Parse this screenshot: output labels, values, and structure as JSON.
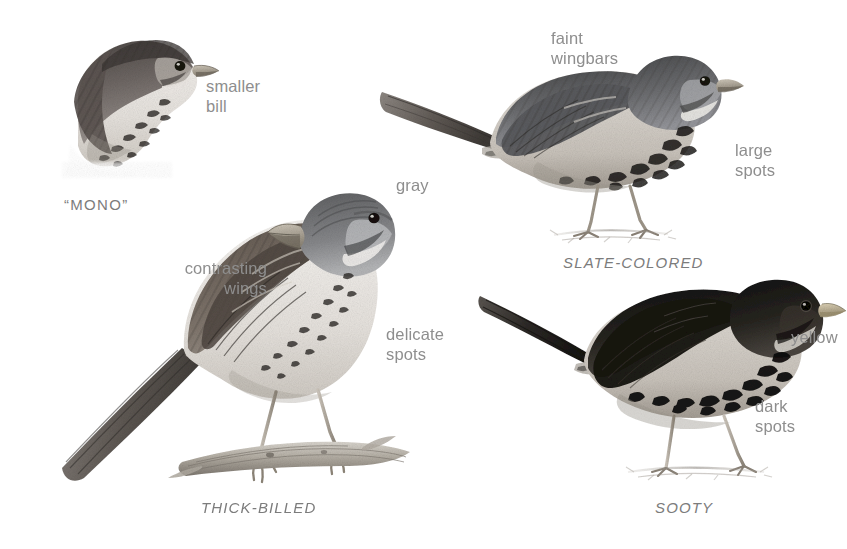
{
  "plate": {
    "kind": "field-guide-illustration-plate",
    "subject": "Fox Sparrow subspecies groups",
    "background_color": "#ffffff",
    "label_color": "#8e8e8e",
    "caption_color": "#7c7c7c",
    "art_style": "grayscale pencil illustration",
    "width": 847,
    "height": 549
  },
  "birds": [
    {
      "id": "mono",
      "caption": "“MONO”",
      "caption_style": "quoted-caps",
      "view": "head-and-breast only, facing right",
      "plumage_tone": "medium gray-brown with white underparts and dark breast spots"
    },
    {
      "id": "slate-colored",
      "caption": "SLATE-COLORED",
      "caption_style": "italic-caps",
      "view": "full body perched on ground, facing right",
      "plumage_tone": "slaty gray upperparts, white underparts with large dark spots"
    },
    {
      "id": "thick-billed",
      "caption": "THICK-BILLED",
      "caption_style": "italic-caps",
      "view": "full body perched on branch, facing right",
      "plumage_tone": "gray head, contrasting brown wings, fine dark breast spots"
    },
    {
      "id": "sooty",
      "caption": "SOOTY",
      "caption_style": "italic-caps",
      "view": "full body standing on ground, facing right",
      "plumage_tone": "very dark sooty brown overall with heavy blackish spotting"
    }
  ],
  "annotations": [
    {
      "id": "smaller-bill",
      "text": "smaller\nbill",
      "bird": "mono",
      "align": "left"
    },
    {
      "id": "faint-wingbars",
      "text": "faint\nwingbars",
      "bird": "slate-colored",
      "align": "left"
    },
    {
      "id": "large-spots",
      "text": "large\nspots",
      "bird": "slate-colored",
      "align": "left"
    },
    {
      "id": "gray",
      "text": "gray",
      "bird": "thick-billed",
      "align": "left"
    },
    {
      "id": "contrasting-wings",
      "text": "contrasting\nwings",
      "bird": "thick-billed",
      "align": "right"
    },
    {
      "id": "delicate-spots",
      "text": "delicate\nspots",
      "bird": "thick-billed",
      "align": "left"
    },
    {
      "id": "yellow",
      "text": "yellow",
      "bird": "sooty",
      "align": "left"
    },
    {
      "id": "dark-spots",
      "text": "dark\nspots",
      "bird": "sooty",
      "align": "left"
    }
  ]
}
